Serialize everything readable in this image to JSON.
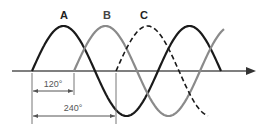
{
  "labels": {
    "a": "A",
    "b": "B",
    "c": "C"
  },
  "annotations": {
    "phase_120": "120°",
    "phase_240": "240°"
  },
  "colors": {
    "a": "#1a1a1a",
    "b": "#8a8a8a",
    "c": "#1a1a1a",
    "axis": "#555555"
  }
}
